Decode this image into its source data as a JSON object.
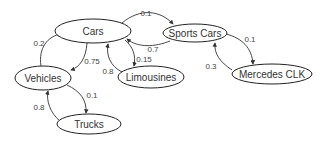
{
  "diagram": {
    "type": "directed-graph",
    "nodes": [
      {
        "id": "cars",
        "label": "Cars"
      },
      {
        "id": "sports_cars",
        "label": "Sports Cars"
      },
      {
        "id": "vehicles",
        "label": "Vehicles"
      },
      {
        "id": "limousines",
        "label": "Limousines"
      },
      {
        "id": "mercedes_clk",
        "label": "Mercedes CLK"
      },
      {
        "id": "trucks",
        "label": "Trucks"
      }
    ],
    "edges": [
      {
        "from": "cars",
        "to": "sports_cars",
        "weight": "0.1"
      },
      {
        "from": "sports_cars",
        "to": "cars",
        "weight": "0.7"
      },
      {
        "from": "vehicles",
        "to": "cars",
        "weight": "0.2"
      },
      {
        "from": "cars",
        "to": "vehicles",
        "weight": "0.75"
      },
      {
        "from": "cars",
        "to": "limousines",
        "weight": "0.15"
      },
      {
        "from": "limousines",
        "to": "cars",
        "weight": "0.8"
      },
      {
        "from": "sports_cars",
        "to": "mercedes_clk",
        "weight": "0.1"
      },
      {
        "from": "mercedes_clk",
        "to": "sports_cars",
        "weight": "0.3"
      },
      {
        "from": "vehicles",
        "to": "trucks",
        "weight": "0.1"
      },
      {
        "from": "trucks",
        "to": "vehicles",
        "weight": "0.8"
      }
    ]
  }
}
